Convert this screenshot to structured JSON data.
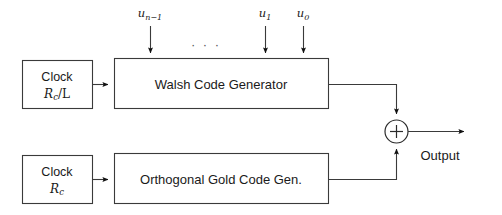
{
  "diagram": {
    "colors": {
      "background": "#ffffff",
      "line": "#3a3a3a",
      "text": "#1a1a1a",
      "arrowhead": "#111111"
    },
    "blocks": [
      {
        "id": "clock-top",
        "line1": "Clock",
        "rate_base": "R",
        "rate_sub": "c",
        "rate_op": "/L"
      },
      {
        "id": "clock-bottom",
        "line1": "Clock",
        "rate_base": "R",
        "rate_sub": "c",
        "rate_op": ""
      },
      {
        "id": "walsh",
        "label": "Walsh Code Generator"
      },
      {
        "id": "gold",
        "label": "Orthogonal Gold Code Gen."
      }
    ],
    "inputs": [
      {
        "id": "u-n-minus-1",
        "base": "u",
        "sub": "n−1"
      },
      {
        "id": "u-1",
        "base": "u",
        "sub": "1"
      },
      {
        "id": "u-0",
        "base": "u",
        "sub": "0"
      }
    ],
    "ellipsis": "· · ·",
    "adder": {
      "id": "summing-junction",
      "symbol": "+"
    },
    "output": {
      "label": "Output"
    }
  }
}
